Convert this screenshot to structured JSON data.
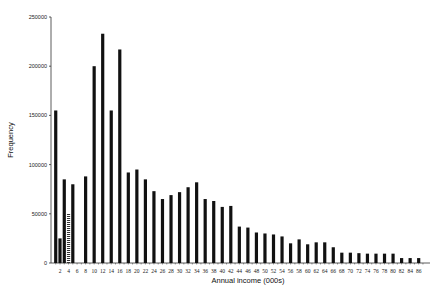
{
  "chart_data": {
    "type": "bar",
    "title": "",
    "xlabel": "Annual income (000s)",
    "ylabel": "Frequency",
    "ylim": [
      0,
      250000
    ],
    "yticks": [
      0,
      50000,
      100000,
      150000,
      200000,
      250000
    ],
    "ytick_labels": [
      "0",
      "50000",
      "100000",
      "150000",
      "200000",
      "250000"
    ],
    "xtick_labels": [
      "2",
      "4",
      "6",
      "8",
      "10",
      "12",
      "14",
      "16",
      "18",
      "20",
      "22",
      "24",
      "26",
      "28",
      "30",
      "32",
      "34",
      "36",
      "38",
      "40",
      "42",
      "44",
      "46",
      "48",
      "50",
      "52",
      "54",
      "56",
      "58",
      "60",
      "62",
      "64",
      "66",
      "68",
      "70",
      "72",
      "74",
      "76",
      "78",
      "80",
      "82",
      "84",
      "86"
    ],
    "grid": false,
    "legend": null,
    "bar_color": "#111111",
    "hatched_bar_color": "#555555",
    "bars": [
      {
        "x": 1,
        "value": 155000
      },
      {
        "x": 2,
        "value": 25000
      },
      {
        "x": 3,
        "value": 85000
      },
      {
        "x": 4,
        "value": 50000,
        "style": "hatched"
      },
      {
        "x": 5,
        "value": 80000
      },
      {
        "x": 8,
        "value": 88000
      },
      {
        "x": 10,
        "value": 200000
      },
      {
        "x": 12,
        "value": 233000
      },
      {
        "x": 14,
        "value": 155000
      },
      {
        "x": 16,
        "value": 217000
      },
      {
        "x": 18,
        "value": 92000
      },
      {
        "x": 20,
        "value": 95000
      },
      {
        "x": 22,
        "value": 85000
      },
      {
        "x": 24,
        "value": 73000
      },
      {
        "x": 26,
        "value": 65000
      },
      {
        "x": 28,
        "value": 69000
      },
      {
        "x": 30,
        "value": 72000
      },
      {
        "x": 32,
        "value": 77000
      },
      {
        "x": 34,
        "value": 82000
      },
      {
        "x": 36,
        "value": 65000
      },
      {
        "x": 38,
        "value": 63000
      },
      {
        "x": 40,
        "value": 57000
      },
      {
        "x": 42,
        "value": 58000
      },
      {
        "x": 44,
        "value": 37000
      },
      {
        "x": 46,
        "value": 36000
      },
      {
        "x": 48,
        "value": 31000
      },
      {
        "x": 50,
        "value": 30000
      },
      {
        "x": 52,
        "value": 29000
      },
      {
        "x": 54,
        "value": 27000
      },
      {
        "x": 56,
        "value": 20000
      },
      {
        "x": 58,
        "value": 24000
      },
      {
        "x": 60,
        "value": 19000
      },
      {
        "x": 62,
        "value": 21000
      },
      {
        "x": 64,
        "value": 21000
      },
      {
        "x": 66,
        "value": 16000
      },
      {
        "x": 68,
        "value": 10500
      },
      {
        "x": 70,
        "value": 10500
      },
      {
        "x": 72,
        "value": 10000
      },
      {
        "x": 74,
        "value": 9500
      },
      {
        "x": 76,
        "value": 9500
      },
      {
        "x": 78,
        "value": 9500
      },
      {
        "x": 80,
        "value": 9500
      },
      {
        "x": 82,
        "value": 5000
      },
      {
        "x": 84,
        "value": 5000
      },
      {
        "x": 86,
        "value": 5000
      }
    ]
  }
}
